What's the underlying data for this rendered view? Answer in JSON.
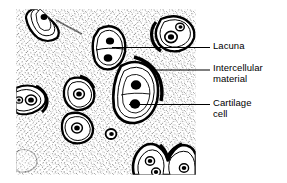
{
  "figure": {
    "kind": "histology-illustration",
    "panel": {
      "x": 16,
      "y": 9,
      "width": 180,
      "height": 166
    },
    "colors": {
      "ink": "#000000",
      "background": "#ffffff",
      "matrix_stipple": "#1a1a1a",
      "leader_line": "#000000"
    }
  },
  "labels": [
    {
      "id": "lacuna",
      "text": "Lacuna",
      "leader": {
        "x1": 112,
        "y1": 47.5,
        "x2": 210,
        "y2": 47.5
      }
    },
    {
      "id": "intercellular",
      "text": "Intercellular\nmaterial",
      "leader": {
        "x1": 152,
        "y1": 70,
        "x2": 210,
        "y2": 70
      }
    },
    {
      "id": "cartilage-cell",
      "text": "Cartilage\ncell",
      "leader": {
        "x1": 129,
        "y1": 104.5,
        "x2": 210,
        "y2": 104.5
      }
    }
  ],
  "structures": {
    "lacunae_count": 11,
    "cartilage_cells_count": 14,
    "description": "Stippled intercellular matrix with oval lacunae each containing one or two cartilage cells with dark nuclei"
  }
}
